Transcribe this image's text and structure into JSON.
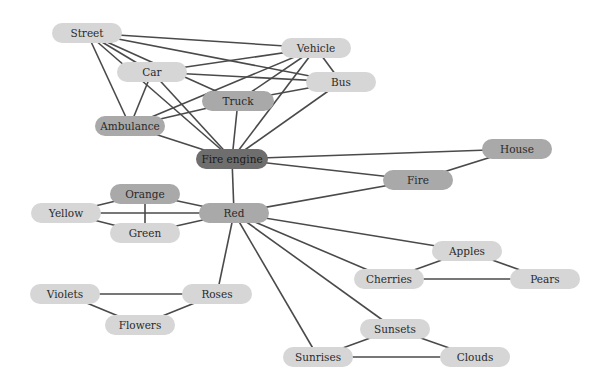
{
  "diagram": {
    "type": "concept-map",
    "colors": {
      "light": "#d6d6d6",
      "medium": "#a9a9a9",
      "dark": "#6e6e6e",
      "edge": "#4a4a4a"
    },
    "nodes": [
      {
        "id": "street",
        "label": "Street",
        "x": 87,
        "y": 33,
        "w": 70,
        "tone": "light"
      },
      {
        "id": "vehicle",
        "label": "Vehicle",
        "x": 316,
        "y": 48,
        "w": 70,
        "tone": "light"
      },
      {
        "id": "car",
        "label": "Car",
        "x": 152,
        "y": 72,
        "w": 70,
        "tone": "light"
      },
      {
        "id": "bus",
        "label": "Bus",
        "x": 341,
        "y": 82,
        "w": 70,
        "tone": "light"
      },
      {
        "id": "truck",
        "label": "Truck",
        "x": 238,
        "y": 101,
        "w": 72,
        "tone": "medium"
      },
      {
        "id": "ambulance",
        "label": "Ambulance",
        "x": 130,
        "y": 126,
        "w": 70,
        "tone": "medium"
      },
      {
        "id": "fire_engine",
        "label": "Fire engine",
        "x": 232,
        "y": 159,
        "w": 72,
        "tone": "dark"
      },
      {
        "id": "house",
        "label": "House",
        "x": 517,
        "y": 149,
        "w": 70,
        "tone": "medium"
      },
      {
        "id": "fire",
        "label": "Fire",
        "x": 418,
        "y": 180,
        "w": 70,
        "tone": "medium"
      },
      {
        "id": "orange",
        "label": "Orange",
        "x": 145,
        "y": 194,
        "w": 70,
        "tone": "medium"
      },
      {
        "id": "yellow",
        "label": "Yellow",
        "x": 66,
        "y": 213,
        "w": 70,
        "tone": "light"
      },
      {
        "id": "red",
        "label": "Red",
        "x": 234,
        "y": 213,
        "w": 70,
        "tone": "medium"
      },
      {
        "id": "green",
        "label": "Green",
        "x": 145,
        "y": 233,
        "w": 70,
        "tone": "light"
      },
      {
        "id": "apples",
        "label": "Apples",
        "x": 467,
        "y": 251,
        "w": 70,
        "tone": "light"
      },
      {
        "id": "cherries",
        "label": "Cherries",
        "x": 389,
        "y": 279,
        "w": 70,
        "tone": "light"
      },
      {
        "id": "pears",
        "label": "Pears",
        "x": 545,
        "y": 279,
        "w": 70,
        "tone": "light"
      },
      {
        "id": "violets",
        "label": "Violets",
        "x": 65,
        "y": 294,
        "w": 70,
        "tone": "light"
      },
      {
        "id": "roses",
        "label": "Roses",
        "x": 217,
        "y": 294,
        "w": 70,
        "tone": "light"
      },
      {
        "id": "flowers",
        "label": "Flowers",
        "x": 140,
        "y": 325,
        "w": 70,
        "tone": "light"
      },
      {
        "id": "sunsets",
        "label": "Sunsets",
        "x": 395,
        "y": 329,
        "w": 70,
        "tone": "light"
      },
      {
        "id": "sunrises",
        "label": "Sunrises",
        "x": 318,
        "y": 357,
        "w": 70,
        "tone": "light"
      },
      {
        "id": "clouds",
        "label": "Clouds",
        "x": 475,
        "y": 357,
        "w": 70,
        "tone": "light"
      }
    ],
    "edges": [
      [
        "street",
        "vehicle"
      ],
      [
        "street",
        "bus"
      ],
      [
        "street",
        "truck"
      ],
      [
        "street",
        "car"
      ],
      [
        "street",
        "ambulance"
      ],
      [
        "street",
        "fire_engine"
      ],
      [
        "car",
        "vehicle"
      ],
      [
        "car",
        "bus"
      ],
      [
        "car",
        "ambulance"
      ],
      [
        "car",
        "fire_engine"
      ],
      [
        "vehicle",
        "ambulance"
      ],
      [
        "vehicle",
        "truck"
      ],
      [
        "vehicle",
        "bus"
      ],
      [
        "vehicle",
        "fire_engine"
      ],
      [
        "bus",
        "truck"
      ],
      [
        "bus",
        "fire_engine"
      ],
      [
        "truck",
        "ambulance"
      ],
      [
        "truck",
        "fire_engine"
      ],
      [
        "ambulance",
        "fire_engine"
      ],
      [
        "fire_engine",
        "house"
      ],
      [
        "fire_engine",
        "fire"
      ],
      [
        "fire_engine",
        "red"
      ],
      [
        "fire",
        "house"
      ],
      [
        "fire",
        "red"
      ],
      [
        "red",
        "orange"
      ],
      [
        "red",
        "yellow"
      ],
      [
        "red",
        "green"
      ],
      [
        "red",
        "roses"
      ],
      [
        "red",
        "apples"
      ],
      [
        "red",
        "cherries"
      ],
      [
        "red",
        "sunsets"
      ],
      [
        "red",
        "sunrises"
      ],
      [
        "orange",
        "yellow"
      ],
      [
        "orange",
        "green"
      ],
      [
        "yellow",
        "green"
      ],
      [
        "violets",
        "roses"
      ],
      [
        "violets",
        "flowers"
      ],
      [
        "roses",
        "flowers"
      ],
      [
        "apples",
        "cherries"
      ],
      [
        "apples",
        "pears"
      ],
      [
        "cherries",
        "pears"
      ],
      [
        "sunsets",
        "sunrises"
      ],
      [
        "sunsets",
        "clouds"
      ],
      [
        "sunrises",
        "clouds"
      ]
    ]
  }
}
